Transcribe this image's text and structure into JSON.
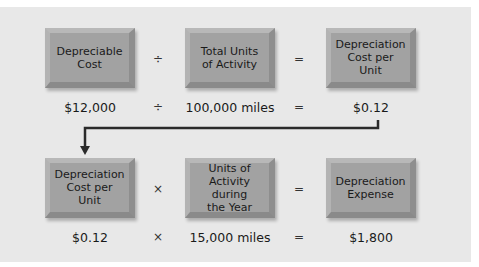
{
  "diagram": {
    "colors": {
      "panel": "#e8e8e8",
      "box": "#a2a2a2",
      "connector": "#2a2a2a"
    },
    "row1": {
      "boxes": [
        "Depreciable\nCost",
        "Total Units\nof Activity",
        "Depreciation\nCost per\nUnit"
      ],
      "operators": [
        "÷",
        "="
      ],
      "values": [
        "$12,000",
        "100,000 miles",
        "$0.12"
      ],
      "value_operators": [
        "÷",
        "="
      ]
    },
    "row2": {
      "boxes": [
        "Depreciation\nCost per\nUnit",
        "Units of\nActivity during\nthe Year",
        "Depreciation\nExpense"
      ],
      "operators": [
        "×",
        "="
      ],
      "values": [
        "$0.12",
        "15,000 miles",
        "$1,800"
      ],
      "value_operators": [
        "×",
        "="
      ]
    },
    "connector": {
      "from": "row1.values.2",
      "to": "row2.boxes.0",
      "icon": "arrow-down-icon"
    }
  }
}
